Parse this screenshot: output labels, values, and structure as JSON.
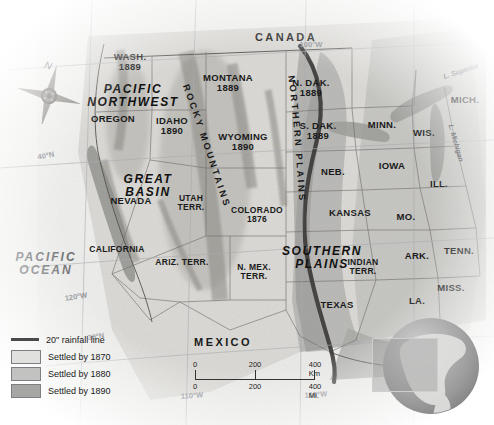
{
  "map": {
    "title": "Westward Settlement of the United States",
    "countries": [
      {
        "name": "CANADA",
        "x": 286,
        "y": 38
      },
      {
        "name": "MEXICO",
        "x": 223,
        "y": 343
      }
    ],
    "oceans": [
      {
        "name": "PACIFIC\nOCEAN",
        "x": 46,
        "y": 264
      }
    ],
    "regions": [
      {
        "name": "PACIFIC\nNORTHWEST",
        "x": 133,
        "y": 96
      },
      {
        "name": "GREAT\nBASIN",
        "x": 148,
        "y": 186
      },
      {
        "name": "SOUTHERN\nPLAINS",
        "x": 322,
        "y": 258
      }
    ],
    "curved_labels": [
      {
        "name": "ROCKY MOUNTAINS"
      },
      {
        "name": "NORTHERN PLAINS"
      }
    ],
    "states": [
      {
        "name": "WASH.",
        "year": "1889",
        "x": 130,
        "y": 62
      },
      {
        "name": "OREGON",
        "year": "",
        "x": 113,
        "y": 119
      },
      {
        "name": "IDAHO",
        "year": "1890",
        "x": 172,
        "y": 126
      },
      {
        "name": "MONTANA",
        "year": "1889",
        "x": 228,
        "y": 83
      },
      {
        "name": "WYOMING",
        "year": "1890",
        "x": 243,
        "y": 142
      },
      {
        "name": "NEVADA",
        "year": "",
        "x": 131,
        "y": 201
      },
      {
        "name": "UTAH\nTERR.",
        "year": "",
        "x": 191,
        "y": 203
      },
      {
        "name": "COLORADO",
        "year": "1876",
        "x": 257,
        "y": 215
      },
      {
        "name": "CALIFORNIA",
        "year": "",
        "x": 117,
        "y": 249
      },
      {
        "name": "ARIZ. TERR.",
        "year": "",
        "x": 182,
        "y": 262
      },
      {
        "name": "N. MEX.\nTERR.",
        "year": "",
        "x": 254,
        "y": 272
      },
      {
        "name": "N. DAK.",
        "year": "1889",
        "x": 311,
        "y": 88
      },
      {
        "name": "S. DAK.",
        "year": "1889",
        "x": 318,
        "y": 131
      },
      {
        "name": "NEB.",
        "year": "",
        "x": 333,
        "y": 172
      },
      {
        "name": "KANSAS",
        "year": "",
        "x": 350,
        "y": 213
      },
      {
        "name": "INDIAN\nTERR.",
        "year": "",
        "x": 363,
        "y": 267
      },
      {
        "name": "TEXAS",
        "year": "",
        "x": 337,
        "y": 305
      },
      {
        "name": "MINN.",
        "year": "",
        "x": 382,
        "y": 125
      },
      {
        "name": "IOWA",
        "year": "",
        "x": 392,
        "y": 166
      },
      {
        "name": "MO.",
        "year": "",
        "x": 406,
        "y": 217
      },
      {
        "name": "ARK.",
        "year": "",
        "x": 417,
        "y": 256
      },
      {
        "name": "LA.",
        "year": "",
        "x": 417,
        "y": 301
      },
      {
        "name": "MISS.",
        "year": "",
        "x": 451,
        "y": 288
      },
      {
        "name": "TENN.",
        "year": "",
        "x": 459,
        "y": 251
      },
      {
        "name": "ILL.",
        "year": "",
        "x": 439,
        "y": 184
      },
      {
        "name": "WIS.",
        "year": "",
        "x": 424,
        "y": 133
      },
      {
        "name": "MICH.",
        "year": "",
        "x": 465,
        "y": 100
      }
    ],
    "lakes": [
      {
        "name": "L. Superior",
        "x": 461,
        "y": 71,
        "rot": -18
      },
      {
        "name": "L. Michigan",
        "x": 456,
        "y": 143,
        "rot": 74
      }
    ],
    "coordinates": [
      {
        "name": "40°N",
        "x": 46,
        "y": 156,
        "rot": -10
      },
      {
        "name": "120°W",
        "x": 76,
        "y": 297,
        "rot": -9
      },
      {
        "name": "30°N",
        "x": 96,
        "y": 337,
        "rot": -9
      },
      {
        "name": "100°W",
        "x": 311,
        "y": 45,
        "rot": 0
      },
      {
        "name": "110°W",
        "x": 192,
        "y": 396,
        "rot": -4
      },
      {
        "name": "100°W",
        "x": 316,
        "y": 395,
        "rot": -4
      }
    ],
    "compass": {
      "label": "N",
      "x": 48,
      "y": 94
    }
  },
  "legend": {
    "items": [
      {
        "label": "20\" rainfall line",
        "type": "line",
        "color": "#4a4a4a"
      },
      {
        "label": "Settled by 1870",
        "type": "swatch",
        "color": "#e0e0de"
      },
      {
        "label": "Settled by 1880",
        "type": "swatch",
        "color": "#c2c2c0"
      },
      {
        "label": "Settled by 1890",
        "type": "swatch",
        "color": "#a6a6a4"
      }
    ]
  },
  "scale": {
    "km": {
      "ticks": [
        "0",
        "200",
        "400 Km"
      ]
    },
    "mi": {
      "ticks": [
        "0",
        "200",
        "400 Mi."
      ]
    }
  },
  "inset": {
    "name": "globe-locator"
  }
}
